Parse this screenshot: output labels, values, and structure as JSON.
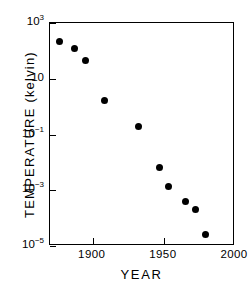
{
  "chart_data": {
    "type": "scatter",
    "title": "",
    "xlabel": "YEAR",
    "ylabel": "TEMPERATURE (kelvin)",
    "xlim": [
      1870,
      2000
    ],
    "ylim": [
      1e-05,
      1000
    ],
    "yscale": "log",
    "xscale": "linear",
    "grid": false,
    "legend": null,
    "xticks": [
      {
        "value": 1900,
        "label": "1900"
      },
      {
        "value": 1950,
        "label": "1950"
      },
      {
        "value": 2000,
        "label": "2000"
      }
    ],
    "yticks": [
      {
        "value": 1000,
        "mantissa": "10",
        "exponent": "3"
      },
      {
        "value": 10,
        "mantissa": "10",
        "exponent": ""
      },
      {
        "value": 0.1,
        "mantissa": "10",
        "exponent": "-1"
      },
      {
        "value": 0.001,
        "mantissa": "10",
        "exponent": "-3"
      },
      {
        "value": 1e-05,
        "mantissa": "10",
        "exponent": "-5"
      }
    ],
    "x": [
      1877,
      1887,
      1895,
      1908,
      1932,
      1947,
      1953,
      1965,
      1972,
      1979
    ],
    "y": [
      220,
      120,
      44,
      1.6,
      0.19,
      0.0063,
      0.0014,
      0.00038,
      0.0002,
      2.5e-05
    ],
    "points": [
      {
        "x": 1877,
        "y": 220
      },
      {
        "x": 1887,
        "y": 120
      },
      {
        "x": 1895,
        "y": 44
      },
      {
        "x": 1908,
        "y": 1.6
      },
      {
        "x": 1932,
        "y": 0.19
      },
      {
        "x": 1947,
        "y": 0.0063
      },
      {
        "x": 1953,
        "y": 0.0014
      },
      {
        "x": 1965,
        "y": 0.00038
      },
      {
        "x": 1972,
        "y": 0.0002
      },
      {
        "x": 1979,
        "y": 2.5e-05
      }
    ],
    "marker": "filled-circle",
    "marker_color": "#000000",
    "axis_color": "#000000",
    "background_color": "#ffffff"
  }
}
